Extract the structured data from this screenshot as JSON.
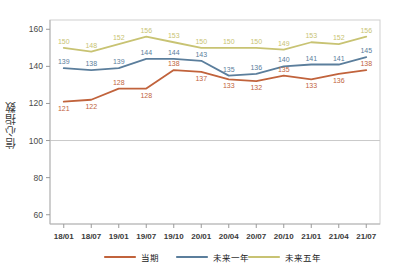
{
  "chart_data": {
    "type": "line",
    "title": "",
    "xlabel": "",
    "ylabel": "信心指数",
    "x": [
      "18/01",
      "18/07",
      "19/01",
      "19/07",
      "19/10",
      "20/01",
      "20/04",
      "20/07",
      "20/10",
      "21/01",
      "21/04",
      "21/07"
    ],
    "ylim": [
      55,
      165
    ],
    "yticks": [
      60,
      80,
      100,
      120,
      140,
      160
    ],
    "grid": "horizontal-single-at-100",
    "legend_position": "bottom",
    "series": [
      {
        "name": "当期",
        "color": "#C1633C",
        "values": [
          121,
          122,
          128,
          128,
          138,
          137,
          133,
          132,
          135,
          133,
          136,
          138
        ]
      },
      {
        "name": "未来一年",
        "color": "#5B7E9C",
        "values": [
          139,
          138,
          139,
          144,
          144,
          143,
          135,
          136,
          140,
          141,
          141,
          145
        ]
      },
      {
        "name": "未来五年",
        "color": "#C8C373",
        "values": [
          150,
          148,
          152,
          156,
          153,
          150,
          150,
          150,
          149,
          153,
          152,
          156
        ]
      }
    ]
  },
  "axis": {
    "y_title": "信心指数",
    "y_tick_labels": [
      "160",
      "140",
      "120",
      "100",
      "80",
      "60"
    ],
    "x_tick_labels": [
      "18/01",
      "18/07",
      "19/01",
      "19/07",
      "19/10",
      "20/01",
      "20/04",
      "20/07",
      "20/10",
      "21/01",
      "21/04",
      "21/07"
    ]
  },
  "legend": {
    "items": [
      {
        "label": "当期",
        "color": "#C1633C"
      },
      {
        "label": "未来一年",
        "color": "#5B7E9C"
      },
      {
        "label": "未来五年",
        "color": "#C8C373"
      }
    ]
  },
  "colors": {
    "current": "#C1633C",
    "next_year": "#5B7E9C",
    "next_five_years": "#C8C373",
    "axis": "#9a9a9a",
    "gridline": "#c9c9c9",
    "plot_border": "#cfcfcf"
  }
}
